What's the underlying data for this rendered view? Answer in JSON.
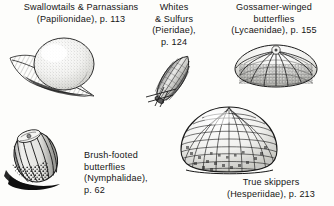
{
  "figure": {
    "background_color": "#fdfdfb",
    "ink_color": "#151515"
  },
  "captions": {
    "swallowtails": {
      "name": "swallowtails-parnassians",
      "lines": [
        "Swallowtails & Parnassians",
        "(Papilionidae), p. 113"
      ],
      "family": "Papilionidae",
      "page": "p. 113",
      "align": "center"
    },
    "whites": {
      "name": "whites-sulfurs",
      "lines": [
        "Whites",
        "& Sulfurs",
        "(Pieridae),",
        "p. 124"
      ],
      "family": "Pieridae",
      "page": "p. 124",
      "align": "center"
    },
    "gossamer": {
      "name": "gossamer-winged-butterflies",
      "lines": [
        "Gossamer-winged",
        "butterflies",
        "(Lycaenidae), p. 155"
      ],
      "family": "Lycaenidae",
      "page": "p. 155",
      "align": "center"
    },
    "brushfooted": {
      "name": "brush-footed-butterflies",
      "lines": [
        "Brush-footed",
        "butterflies",
        "(Nymphalidae),",
        "p. 62"
      ],
      "family": "Nymphalidae",
      "page": "p. 62",
      "align": "left"
    },
    "skippers": {
      "name": "true-skippers",
      "lines": [
        "True skippers",
        "(Hesperiidae), p. 213"
      ],
      "family": "Hesperiidae",
      "page": "p. 213",
      "align": "center"
    }
  },
  "illustrations": [
    {
      "id": "swallowtails-egg",
      "shape": "smooth-spherical-egg-on-leaf",
      "description": "Smooth round stippled egg resting on a leaf blade"
    },
    {
      "id": "whites-egg",
      "shape": "tall-ribbed-spindle-egg",
      "description": "Tall slender vertically ribbed spindle-shaped egg standing on a plant stem"
    },
    {
      "id": "gossamer-egg",
      "shape": "flattened-radial-turban-egg",
      "description": "Flattened turban-shaped egg with radiating ridges and pitted cells"
    },
    {
      "id": "brushfooted-egg",
      "shape": "barrel-ribbed-egg",
      "description": "Barrel-shaped vertically ribbed egg with dark cast shadow"
    },
    {
      "id": "skippers-egg",
      "shape": "dome-reticulate-egg",
      "description": "Dome-shaped egg covered with a reticulate network of raised cells"
    }
  ]
}
